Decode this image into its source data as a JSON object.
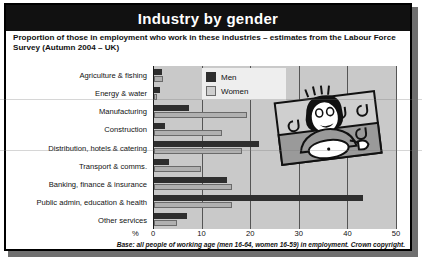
{
  "header": {
    "title": "Industry by gender"
  },
  "subtitle": "Proportion of those in employment who work in these industries – estimates from the Labour Force Survey (Autumn 2004 – UK)",
  "footnote": "Base: all people of working age (men 16-64, women 16-59) in employment. Crown copyright.",
  "axis": {
    "unit_label": "%"
  },
  "legend": {
    "men": "Men",
    "women": "Women"
  },
  "colors": {
    "men": "#2e2e2e",
    "women": "#b0b0b0",
    "plot_bg": "#c9c9c9",
    "title_bar": "#111111"
  },
  "illustration": {
    "alt": "dj-character-illustration"
  },
  "chart_data": {
    "type": "bar",
    "orientation": "horizontal",
    "title": "Industry by gender",
    "subtitle": "Proportion of those in employment who work in these industries – estimates from the Labour Force Survey (Autumn 2004 – UK)",
    "xlabel": "%",
    "ylabel": "",
    "xlim": [
      0,
      50
    ],
    "xticks": [
      0,
      10,
      20,
      30,
      40,
      50
    ],
    "grid": true,
    "legend_position": "top-center",
    "categories": [
      "Agriculture & fishing",
      "Energy & water",
      "Manufacturing",
      "Construction",
      "Distribution, hotels & catering",
      "Transport & comms.",
      "Banking, finance & insurance",
      "Public admin, education & health",
      "Other services"
    ],
    "series": [
      {
        "name": "Men",
        "values": [
          1.6,
          1.3,
          7.3,
          2.2,
          21.7,
          3.1,
          15.0,
          43.0,
          6.8
        ]
      },
      {
        "name": "Women",
        "values": [
          1.9,
          0.6,
          19.2,
          14.0,
          18.2,
          9.7,
          16.0,
          16.1,
          4.7
        ]
      }
    ],
    "annotations": [
      "Base: all people of working age (men 16-64, women 16-59) in employment. Crown copyright."
    ]
  }
}
